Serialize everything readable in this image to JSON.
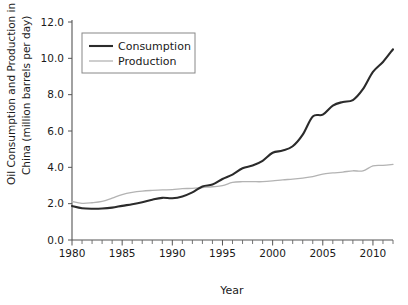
{
  "chart_data": {
    "type": "line",
    "title": "",
    "xlabel": "Year",
    "ylabel": "Oil Consumption and Production in China (million barrels per day)",
    "ylabel_line1": "Oil Consumption and Production in",
    "ylabel_line2": "China (million barrels per day)",
    "xlim": [
      1980,
      2012
    ],
    "ylim": [
      0.0,
      12.0
    ],
    "grid": false,
    "legend_position": "top-left",
    "x_tick_labels": [
      "1980",
      "1985",
      "1990",
      "1995",
      "2000",
      "2005",
      "2010"
    ],
    "x_tick_values": [
      1980,
      1985,
      1990,
      1995,
      2000,
      2005,
      2010
    ],
    "x_minor_tick_step": 1,
    "y_tick_labels": [
      "0.0",
      "2.0",
      "4.0",
      "6.0",
      "8.0",
      "10.0",
      "12.0"
    ],
    "y_tick_values": [
      0.0,
      2.0,
      4.0,
      6.0,
      8.0,
      10.0,
      12.0
    ],
    "x": [
      1980,
      1981,
      1982,
      1983,
      1984,
      1985,
      1986,
      1987,
      1988,
      1989,
      1990,
      1991,
      1992,
      1993,
      1994,
      1995,
      1996,
      1997,
      1998,
      1999,
      2000,
      2001,
      2002,
      2003,
      2004,
      2005,
      2006,
      2007,
      2008,
      2009,
      2010,
      2011,
      2012
    ],
    "series": [
      {
        "name": "Consumption",
        "color": "#2b2b2b",
        "width": 2.1,
        "values": [
          1.87,
          1.75,
          1.72,
          1.73,
          1.78,
          1.88,
          1.97,
          2.08,
          2.22,
          2.32,
          2.3,
          2.4,
          2.62,
          2.95,
          3.05,
          3.36,
          3.6,
          3.95,
          4.1,
          4.36,
          4.8,
          4.92,
          5.16,
          5.8,
          6.8,
          6.9,
          7.4,
          7.6,
          7.7,
          8.3,
          9.25,
          9.8,
          10.5
        ]
      },
      {
        "name": "Production",
        "color": "#b3b3b3",
        "width": 1.3,
        "values": [
          2.12,
          2.02,
          2.05,
          2.12,
          2.3,
          2.5,
          2.62,
          2.69,
          2.73,
          2.76,
          2.77,
          2.83,
          2.84,
          2.89,
          2.93,
          2.99,
          3.17,
          3.21,
          3.21,
          3.21,
          3.25,
          3.31,
          3.35,
          3.41,
          3.49,
          3.63,
          3.69,
          3.74,
          3.81,
          3.8,
          4.08,
          4.11,
          4.16
        ]
      }
    ],
    "legend_entries": [
      {
        "label": "Consumption",
        "color": "#2b2b2b",
        "width": 2.1
      },
      {
        "label": "Production",
        "color": "#b3b3b3",
        "width": 1.3
      }
    ]
  }
}
